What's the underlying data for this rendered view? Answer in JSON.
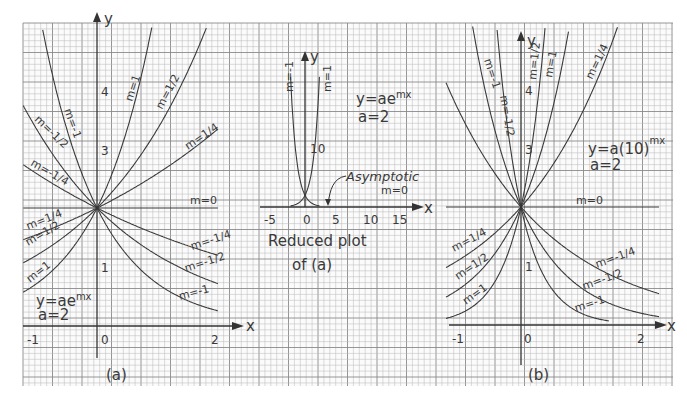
{
  "chart_data": [
    {
      "id": "a",
      "type": "line",
      "caption": "(a)",
      "title": "y=ae^{mx}",
      "equation_label": "y=ae",
      "equation_exp": "mx",
      "param_label": "a=2",
      "a": 2,
      "base": "e",
      "xlabel": "x",
      "ylabel": "y",
      "xlim": [
        -1.2,
        2.3
      ],
      "ylim": [
        -0.4,
        5.0
      ],
      "x_ticks": [
        "-1",
        "0",
        "1",
        "2"
      ],
      "y_ticks": [
        "1",
        "2",
        "3",
        "4"
      ],
      "y_tick_labels_shown": [
        "1",
        "3",
        "4"
      ],
      "grid": true,
      "series": [
        {
          "name": "m=1",
          "m": 1
        },
        {
          "name": "m=1/2",
          "m": 0.5
        },
        {
          "name": "m=1/4",
          "m": 0.25
        },
        {
          "name": "m=0",
          "m": 0
        },
        {
          "name": "m=-1/4",
          "m": -0.25
        },
        {
          "name": "m=-1/2",
          "m": -0.5
        },
        {
          "name": "m=-1",
          "m": -1
        }
      ],
      "curve_labels": [
        "m=1",
        "m=1/2",
        "m=1/4",
        "m=-1",
        "m=-1/2",
        "m=-1/4",
        "m=0",
        "m=-1/4",
        "m=-1/2",
        "m=-1",
        "m=1/4",
        "m=1/2",
        "m=1"
      ]
    },
    {
      "id": "reduced",
      "type": "line",
      "caption": "Reduced plot of (a)",
      "caption_line1": "Reduced plot",
      "caption_line2": "of (a)",
      "equation_label": "y=ae",
      "equation_exp": "mx",
      "param_label": "a=2",
      "a": 2,
      "xlabel": "x",
      "ylabel": "y",
      "xlim": [
        -6,
        18
      ],
      "ylim": [
        0,
        27
      ],
      "x_ticks": [
        "-5",
        "0",
        "5",
        "10",
        "15"
      ],
      "y_ticks": [
        "10"
      ],
      "grid": true,
      "series": [
        {
          "name": "m=-1",
          "m": -1
        },
        {
          "name": "m=1",
          "m": 1
        }
      ],
      "annotation": "Asymptotic",
      "annotation_sub": "m=0"
    },
    {
      "id": "b",
      "type": "line",
      "caption": "(b)",
      "title": "y=a(10)^{mx}",
      "equation_label": "y=a(10)",
      "equation_exp": "mx",
      "param_label": "a=2",
      "a": 2,
      "base": "10",
      "xlabel": "x",
      "ylabel": "y",
      "xlim": [
        -1.2,
        2.3
      ],
      "ylim": [
        -0.4,
        5.0
      ],
      "x_ticks": [
        "-1",
        "0",
        "1",
        "2"
      ],
      "y_ticks": [
        "1",
        "3",
        "4"
      ],
      "grid": true,
      "series": [
        {
          "name": "m=1",
          "m": 1
        },
        {
          "name": "m=1/2",
          "m": 0.5
        },
        {
          "name": "m=1/4",
          "m": 0.25
        },
        {
          "name": "m=0",
          "m": 0
        },
        {
          "name": "m=-1/4",
          "m": -0.25
        },
        {
          "name": "m=-1/2",
          "m": -0.5
        },
        {
          "name": "m=-1",
          "m": -1
        }
      ]
    }
  ],
  "style": {
    "paper": "#fbfbfb",
    "grid_minor": "#b9b9b9",
    "grid_major": "#8a8a8a",
    "ink": "#3a3a3a"
  }
}
